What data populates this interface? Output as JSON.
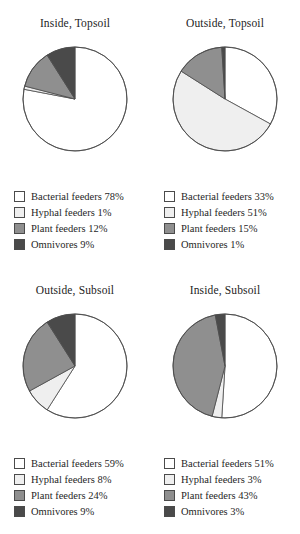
{
  "figure": {
    "type": "pie-panel-grid",
    "rows": 2,
    "cols": 2
  },
  "colors": {
    "bacterial": "#ffffff",
    "hyphal": "#efefef",
    "plant": "#8f8f8f",
    "omnivores": "#4a4a4a",
    "outline": "#4b4b4b",
    "text": "#1f1f1f"
  },
  "categories": [
    "Bacterial feeders",
    "Hyphal feeders",
    "Plant feeders",
    "Omnivores"
  ],
  "panels": [
    {
      "key": "inside-topsoil",
      "title": "Inside, Topsoil",
      "legend": [
        {
          "label": "Bacterial feeders 78%",
          "value": 78,
          "color_key": "bacterial"
        },
        {
          "label": "Hyphal feeders 1%",
          "value": 1,
          "color_key": "hyphal"
        },
        {
          "label": "Plant feeders 12%",
          "value": 12,
          "color_key": "plant"
        },
        {
          "label": "Omnivores 9%",
          "value": 9,
          "color_key": "omnivores"
        }
      ]
    },
    {
      "key": "outside-topsoil",
      "title": "Outside, Topsoil",
      "legend": [
        {
          "label": "Bacterial feeders 33%",
          "value": 33,
          "color_key": "bacterial"
        },
        {
          "label": "Hyphal feeders 51%",
          "value": 51,
          "color_key": "hyphal"
        },
        {
          "label": "Plant feeders 15%",
          "value": 15,
          "color_key": "plant"
        },
        {
          "label": "Omnivores 1%",
          "value": 1,
          "color_key": "omnivores"
        }
      ]
    },
    {
      "key": "outside-subsoil",
      "title": "Outside, Subsoil",
      "legend": [
        {
          "label": "Bacterial feeders 59%",
          "value": 59,
          "color_key": "bacterial"
        },
        {
          "label": "Hyphal feeders 8%",
          "value": 8,
          "color_key": "hyphal"
        },
        {
          "label": "Plant feeders 24%",
          "value": 24,
          "color_key": "plant"
        },
        {
          "label": "Omnivores 9%",
          "value": 9,
          "color_key": "omnivores"
        }
      ]
    },
    {
      "key": "inside-subsoil",
      "title": "Inside, Subsoil",
      "legend": [
        {
          "label": "Bacterial feeders 51%",
          "value": 51,
          "color_key": "bacterial"
        },
        {
          "label": "Hyphal feeders 3%",
          "value": 3,
          "color_key": "hyphal"
        },
        {
          "label": "Plant feeders 43%",
          "value": 43,
          "color_key": "plant"
        },
        {
          "label": "Omnivores 3%",
          "value": 3,
          "color_key": "omnivores"
        }
      ]
    }
  ],
  "chart_data": [
    {
      "type": "pie",
      "title": "Inside, Topsoil",
      "labels": [
        "Bacterial feeders",
        "Hyphal feeders",
        "Plant feeders",
        "Omnivores"
      ],
      "values": [
        78,
        1,
        12,
        9
      ],
      "unit": "%",
      "start_angle_deg": 0,
      "direction": "clockwise",
      "legend_position": "below",
      "grid": false
    },
    {
      "type": "pie",
      "title": "Outside, Topsoil",
      "labels": [
        "Bacterial feeders",
        "Hyphal feeders",
        "Plant feeders",
        "Omnivores"
      ],
      "values": [
        33,
        51,
        15,
        1
      ],
      "unit": "%",
      "start_angle_deg": 0,
      "direction": "clockwise",
      "legend_position": "below",
      "grid": false
    },
    {
      "type": "pie",
      "title": "Outside, Subsoil",
      "labels": [
        "Bacterial feeders",
        "Hyphal feeders",
        "Plant feeders",
        "Omnivores"
      ],
      "values": [
        59,
        8,
        24,
        9
      ],
      "unit": "%",
      "start_angle_deg": 0,
      "direction": "clockwise",
      "legend_position": "below",
      "grid": false
    },
    {
      "type": "pie",
      "title": "Inside, Subsoil",
      "labels": [
        "Bacterial feeders",
        "Hyphal feeders",
        "Plant feeders",
        "Omnivores"
      ],
      "values": [
        51,
        3,
        43,
        3
      ],
      "unit": "%",
      "start_angle_deg": 0,
      "direction": "clockwise",
      "legend_position": "below",
      "grid": false
    }
  ]
}
